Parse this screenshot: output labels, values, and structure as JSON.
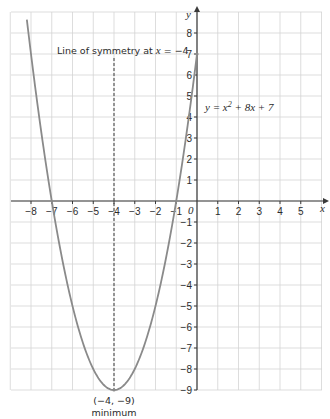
{
  "chart_data": {
    "type": "line",
    "title": "",
    "xlabel": "x",
    "ylabel": "y",
    "xlim": [
      -9,
      6
    ],
    "ylim": [
      -9,
      8.5
    ],
    "grid": true,
    "x_ticks": [
      -8,
      -7,
      -6,
      -5,
      -4,
      -3,
      -2,
      -1,
      1,
      2,
      3,
      4,
      5
    ],
    "y_ticks": [
      -9,
      -8,
      -7,
      -6,
      -5,
      -4,
      -3,
      -2,
      -1,
      1,
      2,
      3,
      4,
      5,
      6,
      7,
      8
    ],
    "origin_label": "0",
    "series": [
      {
        "name": "y = x² + 8x + 7",
        "equation": "x^2 + 8x + 7",
        "x": [
          -8.2,
          -8,
          -7,
          -6,
          -5,
          -4,
          -3,
          -2,
          -1,
          0
        ],
        "y": [
          8.64,
          7,
          0,
          -5,
          -8,
          -9,
          -8,
          -5,
          0,
          7
        ],
        "color": "#8a8a8a"
      }
    ],
    "annotations": [
      {
        "text_prefix": "Line of symmetry at ",
        "var": "x",
        "text_suffix": " = −4",
        "type": "dashed-vertical-line",
        "x": -4
      },
      {
        "text_prefix": "y = x",
        "sup": "2",
        "text_suffix": " + 8x + 7",
        "type": "curve-label"
      },
      {
        "text": "(−4, −9)",
        "type": "point-label",
        "x": -4,
        "y": -9
      },
      {
        "text": "minimum",
        "type": "point-label"
      }
    ],
    "key_points": [
      {
        "label": "minimum",
        "x": -4,
        "y": -9
      },
      {
        "label": "root",
        "x": -7,
        "y": 0
      },
      {
        "label": "root",
        "x": -1,
        "y": 0
      },
      {
        "label": "y-intercept",
        "x": 0,
        "y": 7
      }
    ]
  },
  "labels": {
    "axis_x": "x",
    "axis_y": "y",
    "origin": "0",
    "symmetry_prefix": "Line of symmetry at ",
    "symmetry_var": "x",
    "symmetry_suffix": " = −4",
    "eq_y": "y",
    "eq_eq": " = ",
    "eq_x": "x",
    "eq_sup": "2",
    "eq_mid": " + 8",
    "eq_x2": "x",
    "eq_end": " + 7",
    "min_coords": "(−4, −9)",
    "min_word": "minimum"
  },
  "colors": {
    "grid": "#d4d4d4",
    "axis": "#3a3a3a",
    "curve": "#8a8a8a",
    "text": "#2b2b2b"
  }
}
